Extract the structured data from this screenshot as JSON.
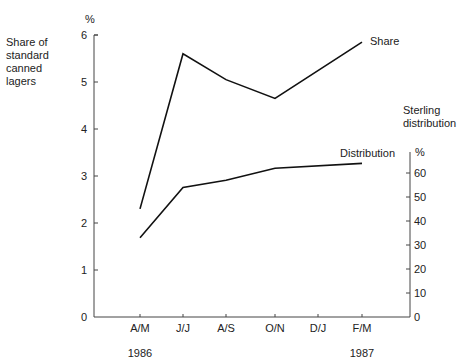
{
  "chart_data": {
    "type": "line",
    "title": "",
    "categories": [
      "A/M",
      "J/J",
      "A/S",
      "O/N",
      "D/J",
      "F/M"
    ],
    "year_labels": [
      {
        "label": "1986",
        "under": "A/M"
      },
      {
        "label": "1987",
        "under": "F/M"
      }
    ],
    "left_axis": {
      "label": [
        "Share of",
        "standard",
        "canned",
        "lagers"
      ],
      "unit": "%",
      "ticks": [
        "0",
        "1",
        "2",
        "3",
        "4",
        "5",
        "6"
      ],
      "range": [
        0,
        6
      ]
    },
    "right_axis": {
      "label": [
        "Sterling",
        "distribution"
      ],
      "unit": "%",
      "ticks": [
        "0",
        "10",
        "20",
        "30",
        "40",
        "50",
        "60"
      ],
      "range": [
        0,
        60
      ]
    },
    "series": [
      {
        "name": "Share",
        "axis": "left",
        "points": [
          {
            "x": "A/M",
            "y": 2.3
          },
          {
            "x": "J/J",
            "y": 5.6
          },
          {
            "x": "A/S",
            "y": 5.05
          },
          {
            "x": "O/N",
            "y": 4.65
          },
          {
            "x": "F/M",
            "y": 5.85
          }
        ]
      },
      {
        "name": "Distribution",
        "axis": "right",
        "points": [
          {
            "x": "A/M",
            "y": 33
          },
          {
            "x": "J/J",
            "y": 54
          },
          {
            "x": "A/S",
            "y": 57
          },
          {
            "x": "O/N",
            "y": 62
          },
          {
            "x": "F/M",
            "y": 64
          }
        ]
      }
    ],
    "grid": false,
    "legend": "inline labels at line ends"
  }
}
